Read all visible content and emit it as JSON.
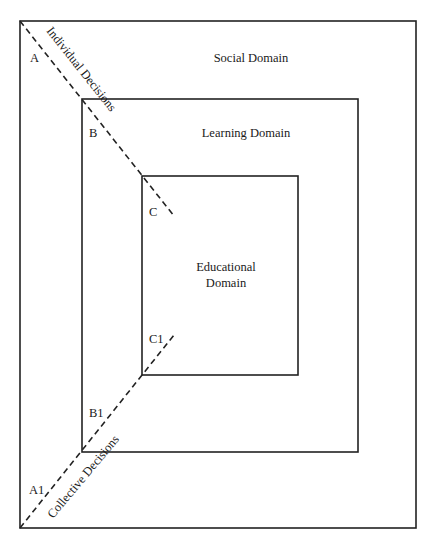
{
  "diagram": {
    "domains": {
      "social": {
        "label": "Social Domain"
      },
      "learning": {
        "label": "Learning Domain"
      },
      "educational": {
        "label_line1": "Educational",
        "label_line2": "Domain"
      }
    },
    "points": {
      "A": "A",
      "B": "B",
      "C": "C",
      "A1": "A1",
      "B1": "B1",
      "C1": "C1"
    },
    "axes": {
      "individual": "Individual Decisions",
      "collective": "Collective Decisions"
    },
    "colors": {
      "stroke": "#222222",
      "background": "#ffffff"
    }
  }
}
